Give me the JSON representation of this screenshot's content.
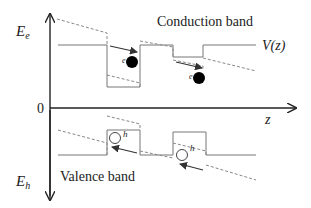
{
  "diagram": {
    "labels": {
      "energy_electron": "E",
      "energy_electron_sub": "e",
      "energy_hole": "E",
      "energy_hole_sub": "h",
      "origin": "0",
      "z_axis": "z",
      "potential": "V(z)",
      "conduction_band": "Conduction band",
      "valence_band": "Valence band",
      "electron_1": "e",
      "electron_2": "e",
      "hole_1": "h",
      "hole_2": "h"
    },
    "colors": {
      "axis": "#222222",
      "band_line": "#777777",
      "field_dashed": "#888888",
      "electron": "#000000",
      "hole_fill": "#ffffff"
    }
  }
}
